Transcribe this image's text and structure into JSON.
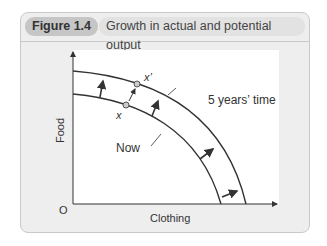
{
  "figure": {
    "label": "Figure 1.4",
    "title": "Growth in actual and potential output"
  },
  "diagram": {
    "y_axis_label": "Food",
    "x_axis_label": "Clothing",
    "origin_label": "O",
    "curves": [
      {
        "name": "Now",
        "label": "Now"
      },
      {
        "name": "5 years' time",
        "label": "5 years’ time"
      }
    ],
    "points": [
      {
        "name": "x",
        "label": "x"
      },
      {
        "name": "x'",
        "label": "x’"
      }
    ],
    "colors": {
      "panel_bg": "#eeeeee",
      "plot_bg": "#ffffff",
      "line": "#333333",
      "point_fill": "#cccccc"
    }
  }
}
